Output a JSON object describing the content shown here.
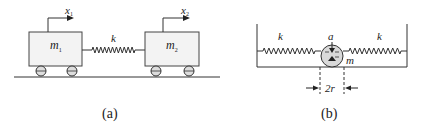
{
  "figure": {
    "panel_a": {
      "caption": "(a)",
      "mass_left": {
        "label": "m",
        "subscript": "1"
      },
      "mass_right": {
        "label": "m",
        "subscript": "2"
      },
      "spring_label": "k",
      "disp_left": {
        "label": "x",
        "subscript": "1"
      },
      "disp_right": {
        "label": "x",
        "subscript": "2"
      }
    },
    "panel_b": {
      "caption": "(b)",
      "spring_left_label": "k",
      "spring_right_label": "k",
      "pivot_label": "a",
      "mass_label": "m",
      "diameter_label": "2r"
    }
  }
}
